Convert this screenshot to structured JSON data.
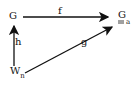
{
  "diagram": {
    "nodes": {
      "top_left": {
        "main": "G"
      },
      "top_right": {
        "main": "G",
        "subscript": "a",
        "underline": "double"
      },
      "bottom_left": {
        "main": "W",
        "subscript": "n"
      }
    },
    "arrows": {
      "top": {
        "label": "f",
        "from": "G",
        "to": "G_a"
      },
      "left": {
        "label": "h",
        "from": "W_n",
        "to": "G"
      },
      "diagonal": {
        "label": "g",
        "from": "W_n",
        "to": "G_a"
      }
    }
  }
}
